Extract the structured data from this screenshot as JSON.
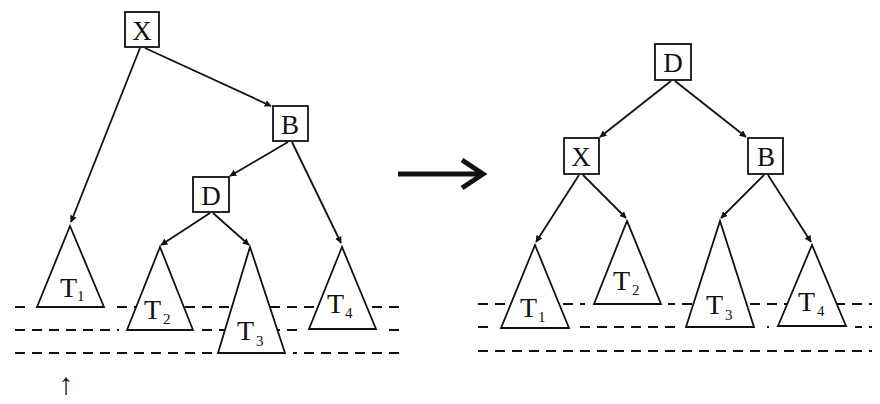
{
  "diagram": {
    "type": "avl-double-rotation",
    "before": {
      "nodes": [
        {
          "id": "X",
          "label": "X",
          "x": 142,
          "y": 30
        },
        {
          "id": "B",
          "label": "B",
          "x": 290,
          "y": 123
        },
        {
          "id": "D",
          "label": "D",
          "x": 211,
          "y": 195
        }
      ],
      "subtrees": [
        {
          "id": "T1",
          "label": "T",
          "sub": "1",
          "apex": [
            70,
            226
          ],
          "base_y": 307,
          "half_width": 34
        },
        {
          "id": "T2",
          "label": "T",
          "sub": "2",
          "apex": [
            160,
            247
          ],
          "base_y": 330,
          "half_width": 33
        },
        {
          "id": "T3",
          "label": "T",
          "sub": "3",
          "apex": [
            250,
            247
          ],
          "base_y": 353,
          "half_width": 34
        },
        {
          "id": "T4",
          "label": "T",
          "sub": "4",
          "apex": [
            342,
            247
          ],
          "base_y": 329,
          "half_width": 33
        }
      ],
      "edges": [
        [
          "X",
          "T1"
        ],
        [
          "X",
          "B"
        ],
        [
          "B",
          "D"
        ],
        [
          "B",
          "T4"
        ],
        [
          "D",
          "T2"
        ],
        [
          "D",
          "T3"
        ]
      ],
      "levels_y": [
        307,
        330,
        353
      ],
      "marker": {
        "symbol": "↑",
        "x": 66,
        "y": 381,
        "meaning": "insertion point below T3 level"
      }
    },
    "transition_arrow": {
      "symbol": "→",
      "from": [
        398,
        174
      ],
      "to": [
        485,
        174
      ]
    },
    "after": {
      "nodes": [
        {
          "id": "D",
          "label": "D",
          "x": 673,
          "y": 62
        },
        {
          "id": "X",
          "label": "X",
          "x": 581,
          "y": 156
        },
        {
          "id": "B",
          "label": "B",
          "x": 766,
          "y": 156
        }
      ],
      "subtrees": [
        {
          "id": "T1",
          "label": "T",
          "sub": "1",
          "apex": [
            535,
            245
          ],
          "base_y": 328,
          "half_width": 34
        },
        {
          "id": "T2",
          "label": "T",
          "sub": "2",
          "apex": [
            627,
            221
          ],
          "base_y": 304,
          "half_width": 34
        },
        {
          "id": "T3",
          "label": "T",
          "sub": "3",
          "apex": [
            720,
            221
          ],
          "base_y": 327,
          "half_width": 34
        },
        {
          "id": "T4",
          "label": "T",
          "sub": "4",
          "apex": [
            812,
            245
          ],
          "base_y": 326,
          "half_width": 34
        }
      ],
      "edges": [
        [
          "D",
          "X"
        ],
        [
          "D",
          "B"
        ],
        [
          "X",
          "T1"
        ],
        [
          "X",
          "T2"
        ],
        [
          "B",
          "T3"
        ],
        [
          "B",
          "T4"
        ]
      ],
      "levels_y": [
        304,
        327,
        351
      ]
    },
    "labels": {
      "X": "X",
      "B": "B",
      "D": "D",
      "T": "T",
      "sub1": "1",
      "sub2": "2",
      "sub3": "3",
      "sub4": "4",
      "up_arrow": "↑"
    }
  }
}
